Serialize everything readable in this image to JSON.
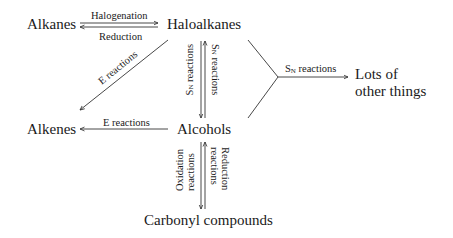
{
  "nodes": {
    "alkanes": "Alkanes",
    "haloalkanes": "Haloalkanes",
    "alkenes": "Alkenes",
    "alcohols": "Alcohols",
    "carbonyl": "Carbonyl compounds",
    "lots_line1": "Lots of",
    "lots_line2": "other things"
  },
  "edges": {
    "halogenation": "Halogenation",
    "reduction": "Reduction",
    "e_reactions_diag": "E reactions",
    "e_reactions_horiz": "E reactions",
    "sn_left_S": "S",
    "sn_left_N": "N",
    "sn_left_rest": " reactions",
    "sn_right_S": "S",
    "sn_right_N": "N",
    "sn_right_rest": " reactions",
    "sn_fork_S": "S",
    "sn_fork_N": "N",
    "sn_fork_rest": " reactions",
    "oxidation_l1": "Oxidation",
    "oxidation_l2": "reactions",
    "reduction_v_l1": "Reduction",
    "reduction_v_l2": "reactions"
  }
}
